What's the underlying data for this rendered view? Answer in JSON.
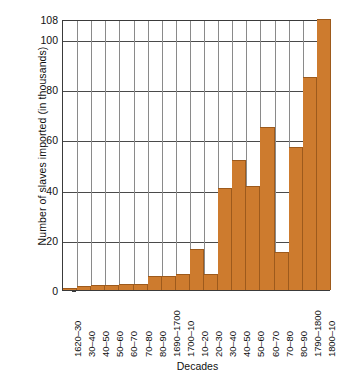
{
  "chart_data": {
    "type": "bar",
    "title": "",
    "xlabel": "Decades",
    "ylabel": "Number of slaves imported (in thousands)",
    "ylim": [
      0,
      108
    ],
    "yticks": [
      0,
      20,
      40,
      60,
      80,
      100,
      108
    ],
    "ytick_labels": [
      "0",
      "20",
      "40",
      "60",
      "80",
      "100",
      "108"
    ],
    "grid": true,
    "legend": "none",
    "bar_color": "#cd7b2e",
    "bar_edge_color": "#9d5a1c",
    "axis_color": "#3a3a3a",
    "gridline_color": "#4a4a4a",
    "separator_color": "#8a8a8a",
    "categories": [
      "1620–30",
      "30–40",
      "40–50",
      "50–60",
      "60–70",
      "70–80",
      "80–90",
      "1690–1700",
      "1700–10",
      "10–20",
      "20–30",
      "30–40",
      "40–50",
      "50–60",
      "60–70",
      "70–80",
      "80–90",
      "1790–1800",
      "1800–10"
    ],
    "values": [
      1,
      1.5,
      2,
      2,
      2.5,
      2.5,
      5.5,
      5.5,
      6.5,
      16.5,
      6.5,
      40.5,
      52,
      41.5,
      65,
      15,
      57,
      85,
      108
    ]
  }
}
